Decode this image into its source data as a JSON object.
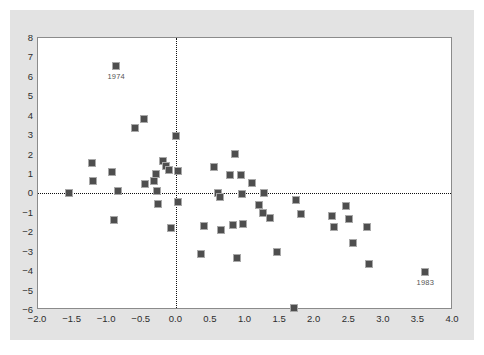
{
  "chart_data": {
    "type": "scatter",
    "title": "",
    "xlabel": "",
    "ylabel": "",
    "xlim": [
      -2.0,
      4.0
    ],
    "ylim": [
      -6,
      8
    ],
    "xticks": [
      "-2.0",
      "-1.5",
      "-1.0",
      "-0.5",
      "0.0",
      "0.5",
      "1.0",
      "1.5",
      "2.0",
      "2.5",
      "3.0",
      "3.5",
      "4.0"
    ],
    "xtick_values": [
      -2.0,
      -1.5,
      -1.0,
      -0.5,
      0.0,
      0.5,
      1.0,
      1.5,
      2.0,
      2.5,
      3.0,
      3.5,
      4.0
    ],
    "yticks": [
      "8",
      "7",
      "6",
      "5",
      "4",
      "3",
      "2",
      "1",
      "0",
      "-1",
      "-2",
      "-3",
      "-4",
      "-5",
      "-6"
    ],
    "ytick_values": [
      8,
      7,
      6,
      5,
      4,
      3,
      2,
      1,
      0,
      -1,
      -2,
      -3,
      -4,
      -5,
      -6
    ],
    "grid": false,
    "legend": "none",
    "reference_lines": [
      {
        "orientation": "horizontal",
        "value": 0,
        "style": "dotted",
        "color": "#111111"
      },
      {
        "orientation": "vertical",
        "value": 0,
        "style": "dotted",
        "color": "#111111"
      }
    ],
    "marker_color": "#4e4e4e",
    "marker_edge_color": "#a9a9a9",
    "marker_shape": "square",
    "points": [
      {
        "x": -1.55,
        "y": 0.0
      },
      {
        "x": -1.22,
        "y": 1.55
      },
      {
        "x": -1.2,
        "y": 0.65
      },
      {
        "x": -0.93,
        "y": 1.1
      },
      {
        "x": -0.9,
        "y": -1.35
      },
      {
        "x": -0.87,
        "y": 6.55,
        "label": "1974"
      },
      {
        "x": -0.85,
        "y": 0.1
      },
      {
        "x": -0.6,
        "y": 3.35
      },
      {
        "x": -0.47,
        "y": 3.85
      },
      {
        "x": -0.45,
        "y": 0.5
      },
      {
        "x": -0.33,
        "y": 0.65
      },
      {
        "x": -0.3,
        "y": 1.0
      },
      {
        "x": -0.28,
        "y": 0.1
      },
      {
        "x": -0.27,
        "y": -0.55
      },
      {
        "x": -0.2,
        "y": 1.65
      },
      {
        "x": -0.15,
        "y": 1.4
      },
      {
        "x": -0.1,
        "y": 1.2
      },
      {
        "x": -0.07,
        "y": -1.8
      },
      {
        "x": 0.0,
        "y": 2.95
      },
      {
        "x": 0.02,
        "y": 1.15
      },
      {
        "x": 0.03,
        "y": -0.45
      },
      {
        "x": 0.35,
        "y": -3.1
      },
      {
        "x": 0.4,
        "y": -1.7
      },
      {
        "x": 0.55,
        "y": 1.35
      },
      {
        "x": 0.6,
        "y": 0.0
      },
      {
        "x": 0.63,
        "y": -0.2
      },
      {
        "x": 0.65,
        "y": -1.9
      },
      {
        "x": 0.78,
        "y": 0.95
      },
      {
        "x": 0.82,
        "y": -1.6
      },
      {
        "x": 0.85,
        "y": 2.05
      },
      {
        "x": 0.88,
        "y": -3.3
      },
      {
        "x": 0.93,
        "y": 0.95
      },
      {
        "x": 0.95,
        "y": -0.05
      },
      {
        "x": 0.97,
        "y": -1.55
      },
      {
        "x": 1.1,
        "y": 0.55
      },
      {
        "x": 1.2,
        "y": -0.6
      },
      {
        "x": 1.25,
        "y": -1.0
      },
      {
        "x": 1.27,
        "y": 0.0
      },
      {
        "x": 1.35,
        "y": -1.25
      },
      {
        "x": 1.45,
        "y": -3.0
      },
      {
        "x": 1.7,
        "y": -5.9
      },
      {
        "x": 1.73,
        "y": -0.35
      },
      {
        "x": 1.8,
        "y": -1.05
      },
      {
        "x": 2.25,
        "y": -1.15
      },
      {
        "x": 2.28,
        "y": -1.75
      },
      {
        "x": 2.45,
        "y": -0.65
      },
      {
        "x": 2.5,
        "y": -1.3
      },
      {
        "x": 2.55,
        "y": -2.55
      },
      {
        "x": 2.75,
        "y": -1.75
      },
      {
        "x": 2.78,
        "y": -3.65
      },
      {
        "x": 3.6,
        "y": -4.05,
        "label": "1983"
      }
    ]
  }
}
